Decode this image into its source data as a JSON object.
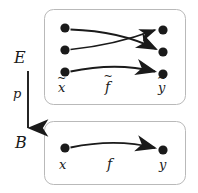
{
  "figure": {
    "type": "commutative-diagram",
    "background_color": "#ffffff",
    "ink_color": "#1a1a1a",
    "box_border_color": "#b9b9b9",
    "dot_color": "#1a1a1a",
    "width": 198,
    "height": 193
  },
  "projection": {
    "total_space_label": "E",
    "base_space_label": "B",
    "map_label": "p",
    "arrow_direction": "down",
    "arrow": {
      "x": 28,
      "y_start": 71,
      "y_end": 133
    }
  },
  "upper_box": {
    "name": "total-space-fiber",
    "bounds": {
      "x": 44,
      "y": 9,
      "width": 142,
      "height": 96
    },
    "source_label": "x",
    "source_accent": "~",
    "map_label": "f",
    "map_accent": "~",
    "target_label": "y",
    "target_accent": "~",
    "left_points": [
      {
        "cx": 65,
        "cy": 28,
        "r": 4.6
      },
      {
        "cx": 65,
        "cy": 50,
        "r": 4.6
      },
      {
        "cx": 65,
        "cy": 72,
        "r": 4.6
      }
    ],
    "right_points": [
      {
        "cx": 163,
        "cy": 30,
        "r": 4.6
      },
      {
        "cx": 163,
        "cy": 52,
        "r": 4.6
      },
      {
        "cx": 163,
        "cy": 74,
        "r": 4.6
      }
    ],
    "arrows": [
      {
        "name": "lift-arrow-cross-down",
        "from": [
          65,
          28
        ],
        "to": [
          163,
          52
        ],
        "control": [
          118,
          30
        ],
        "crosses": true
      },
      {
        "name": "lift-arrow-cross-up",
        "from": [
          65,
          50
        ],
        "to": [
          163,
          30
        ],
        "control": [
          114,
          44
        ],
        "crosses": true
      },
      {
        "name": "lift-arrow-lower",
        "from": [
          65,
          72
        ],
        "to": [
          163,
          74
        ],
        "control": [
          114,
          62
        ],
        "crosses": false
      }
    ]
  },
  "lower_box": {
    "name": "base-space-fiber",
    "bounds": {
      "x": 44,
      "y": 121,
      "width": 142,
      "height": 64
    },
    "source_label": "x",
    "map_label": "f",
    "target_label": "y",
    "left_points": [
      {
        "cx": 65,
        "cy": 148,
        "r": 4.6
      }
    ],
    "right_points": [
      {
        "cx": 163,
        "cy": 150,
        "r": 4.6
      }
    ],
    "arrows": [
      {
        "name": "base-arrow",
        "from": [
          65,
          148
        ],
        "to": [
          163,
          150
        ],
        "control": [
          114,
          138
        ],
        "crosses": false
      }
    ]
  }
}
